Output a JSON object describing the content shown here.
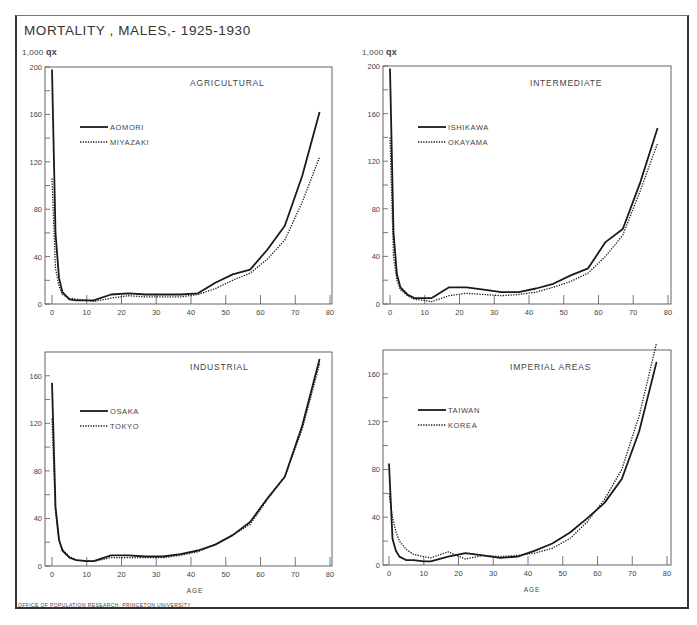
{
  "figure": {
    "title": "MORTALITY , MALES,- 1925-1930",
    "y_unit_label_prefix": "1,000",
    "y_unit_label_symbol": "qx",
    "x_axis_label": "AGE",
    "footer": "OFFICE OF POPULATION RESEARCH, PRINCETON UNIVERSITY",
    "colors": {
      "line": "#1a1a1a",
      "frame": "#555555",
      "text": "#444444"
    }
  },
  "chart_data": [
    {
      "type": "line",
      "title": "AGRICULTURAL",
      "xlabel": "",
      "ylabel": "1,000 qx",
      "xlim": [
        0,
        80
      ],
      "ylim": [
        0,
        200
      ],
      "xticks": [
        0,
        10,
        20,
        30,
        40,
        50,
        60,
        70,
        80
      ],
      "yticks": [
        0,
        40,
        80,
        120,
        160,
        200
      ],
      "grid": false,
      "legend_position": "upper-left",
      "series": [
        {
          "name": "AOMORI",
          "style": "solid",
          "x": [
            0,
            1,
            2,
            3,
            5,
            7,
            10,
            12,
            17,
            22,
            27,
            32,
            37,
            42,
            47,
            52,
            57,
            62,
            67,
            72,
            77
          ],
          "y": [
            198,
            60,
            22,
            10,
            4,
            3,
            3,
            3,
            8,
            9,
            8,
            8,
            8,
            9,
            18,
            25,
            29,
            46,
            66,
            108,
            162
          ]
        },
        {
          "name": "MIYAZAKI",
          "style": "dotted",
          "x": [
            0,
            1,
            2,
            3,
            5,
            7,
            10,
            12,
            17,
            22,
            27,
            32,
            37,
            42,
            47,
            52,
            57,
            62,
            67,
            72,
            77
          ],
          "y": [
            106,
            30,
            15,
            8,
            5,
            4,
            3,
            2,
            5,
            7,
            6,
            6,
            6,
            8,
            13,
            20,
            26,
            38,
            54,
            86,
            124
          ]
        }
      ]
    },
    {
      "type": "line",
      "title": "INTERMEDIATE",
      "xlabel": "",
      "ylabel": "1,000 qx",
      "xlim": [
        0,
        80
      ],
      "ylim": [
        0,
        200
      ],
      "xticks": [
        0,
        10,
        20,
        30,
        40,
        50,
        60,
        70,
        80
      ],
      "yticks": [
        0,
        40,
        80,
        120,
        160,
        200
      ],
      "grid": false,
      "legend_position": "upper-left",
      "series": [
        {
          "name": "ISHIKAWA",
          "style": "solid",
          "x": [
            0,
            1,
            2,
            3,
            5,
            7,
            10,
            12,
            17,
            22,
            27,
            32,
            37,
            42,
            47,
            52,
            57,
            62,
            67,
            72,
            77
          ],
          "y": [
            198,
            60,
            25,
            14,
            8,
            5,
            5,
            5,
            14,
            14,
            12,
            10,
            10,
            13,
            17,
            24,
            30,
            52,
            63,
            102,
            148
          ]
        },
        {
          "name": "OKAYAMA",
          "style": "dotted",
          "x": [
            0,
            1,
            2,
            3,
            5,
            7,
            10,
            12,
            17,
            22,
            27,
            32,
            37,
            42,
            47,
            52,
            57,
            62,
            67,
            72,
            77
          ],
          "y": [
            140,
            40,
            20,
            12,
            7,
            4,
            3,
            2,
            7,
            9,
            8,
            7,
            8,
            10,
            14,
            19,
            26,
            40,
            58,
            95,
            135
          ]
        }
      ]
    },
    {
      "type": "line",
      "title": "INDUSTRIAL",
      "xlabel": "AGE",
      "ylabel": "",
      "xlim": [
        0,
        80
      ],
      "ylim": [
        0,
        180
      ],
      "xticks": [
        0,
        10,
        20,
        30,
        40,
        50,
        60,
        70,
        80
      ],
      "yticks": [
        0,
        40,
        80,
        120,
        160
      ],
      "grid": false,
      "legend_position": "upper-left",
      "series": [
        {
          "name": "OSAKA",
          "style": "solid",
          "x": [
            0,
            1,
            2,
            3,
            5,
            7,
            10,
            12,
            17,
            22,
            27,
            32,
            37,
            42,
            47,
            52,
            57,
            62,
            67,
            72,
            77
          ],
          "y": [
            154,
            50,
            22,
            13,
            7,
            5,
            4,
            4,
            9,
            9,
            8,
            8,
            10,
            13,
            18,
            26,
            37,
            57,
            75,
            118,
            174
          ]
        },
        {
          "name": "TOKYO",
          "style": "dotted",
          "x": [
            0,
            1,
            2,
            3,
            5,
            7,
            10,
            12,
            17,
            22,
            27,
            32,
            37,
            42,
            47,
            52,
            57,
            62,
            67,
            72,
            77
          ],
          "y": [
            124,
            45,
            22,
            14,
            8,
            5,
            4,
            4,
            7,
            7,
            7,
            7,
            9,
            12,
            18,
            26,
            35,
            56,
            75,
            115,
            170
          ]
        }
      ]
    },
    {
      "type": "line",
      "title": "IMPERIAL AREAS",
      "xlabel": "AGE",
      "ylabel": "",
      "xlim": [
        0,
        80
      ],
      "ylim": [
        0,
        180
      ],
      "xticks": [
        0,
        10,
        20,
        30,
        40,
        50,
        60,
        70,
        80
      ],
      "yticks": [
        0,
        40,
        80,
        120,
        160
      ],
      "grid": false,
      "legend_position": "upper-left",
      "series": [
        {
          "name": "TAIWAN",
          "style": "solid",
          "x": [
            0,
            1,
            2,
            3,
            5,
            7,
            10,
            12,
            17,
            22,
            27,
            32,
            37,
            42,
            47,
            52,
            57,
            62,
            67,
            72,
            77
          ],
          "y": [
            85,
            22,
            12,
            7,
            4,
            4,
            3,
            3,
            7,
            10,
            8,
            6,
            7,
            12,
            18,
            27,
            39,
            52,
            72,
            112,
            170
          ]
        },
        {
          "name": "KOREA",
          "style": "dotted",
          "x": [
            0,
            1,
            2,
            3,
            5,
            7,
            10,
            12,
            17,
            22,
            27,
            32,
            37,
            42,
            47,
            52,
            57,
            62,
            67,
            72,
            77
          ],
          "y": [
            60,
            40,
            28,
            20,
            13,
            9,
            7,
            6,
            11,
            5,
            8,
            7,
            8,
            10,
            14,
            22,
            36,
            55,
            80,
            125,
            186
          ]
        }
      ]
    }
  ]
}
